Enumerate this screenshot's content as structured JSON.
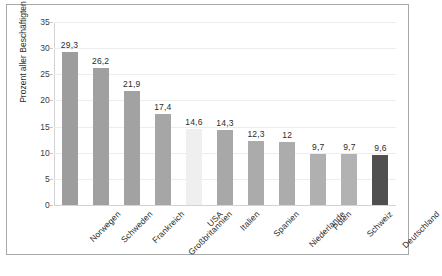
{
  "chart_data": {
    "type": "bar",
    "title": "",
    "subtitle": "",
    "xlabel": "",
    "ylabel": "Prozent aller Beschäftigten",
    "ylim": [
      0,
      35
    ],
    "ytick_step": 5,
    "yticks": [
      "0",
      "5",
      "10",
      "15",
      "20",
      "25",
      "30",
      "35"
    ],
    "grid": true,
    "legend": "none",
    "categories": [
      "Norwegen",
      "Schweden",
      "Frankreich",
      "Großbritannien",
      "USA",
      "Italien",
      "Spanien",
      "Niederlande",
      "Polen",
      "Schweiz",
      "Deutschland"
    ],
    "values": [
      29.3,
      26.2,
      21.9,
      17.4,
      14.6,
      14.3,
      12.3,
      12,
      9.7,
      9.7,
      9.6
    ],
    "value_labels": [
      "29,3",
      "26,2",
      "21,9",
      "17,4",
      "14,6",
      "14,3",
      "12,3",
      "12",
      "9,7",
      "9,7",
      "9,6"
    ],
    "bar_colors": [
      "#9d9d9d",
      "#a0a0a0",
      "#a2a2a2",
      "#a6a6a6",
      "#efefef",
      "#a8a8a8",
      "#ababab",
      "#acacac",
      "#b0b0b0",
      "#b2b2b2",
      "#4f4f4f"
    ]
  },
  "colors": {
    "frame_border": "#a8a8a8",
    "gridline": "#ededed",
    "axis_line": "#d3d3d3",
    "text": "#2b2b2b",
    "highlight_bar": "#4f4f4f",
    "light_bar": "#efefef",
    "default_bar": "#a6a6a6",
    "background": "#ffffff"
  }
}
